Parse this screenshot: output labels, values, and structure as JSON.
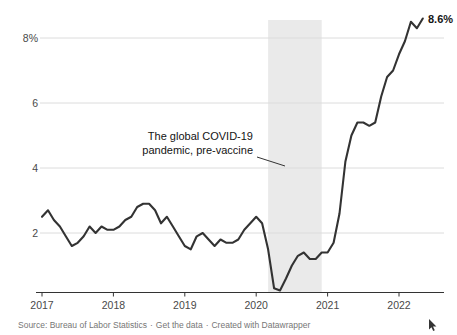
{
  "chart_data": {
    "type": "line",
    "series_name": "US inflation, 12-month change in consumer price index",
    "frequency": "monthly",
    "start": "2017-01",
    "end": "2022-05",
    "values": [
      2.5,
      2.7,
      2.4,
      2.2,
      1.9,
      1.6,
      1.7,
      1.9,
      2.2,
      2.0,
      2.2,
      2.1,
      2.1,
      2.2,
      2.4,
      2.5,
      2.8,
      2.9,
      2.9,
      2.7,
      2.3,
      2.5,
      2.2,
      1.9,
      1.6,
      1.5,
      1.9,
      2.0,
      1.8,
      1.6,
      1.8,
      1.7,
      1.7,
      1.8,
      2.1,
      2.3,
      2.5,
      2.3,
      1.5,
      0.3,
      0.1,
      0.6,
      1.0,
      1.3,
      1.4,
      1.2,
      1.2,
      1.4,
      1.4,
      1.7,
      2.6,
      4.2,
      5.0,
      5.4,
      5.4,
      5.3,
      5.4,
      6.2,
      6.8,
      7.0,
      7.5,
      7.9,
      8.5,
      8.3,
      8.6
    ],
    "x_tick_labels": [
      "2017",
      "2018",
      "2019",
      "2020",
      "2021",
      "2022"
    ],
    "y_ticks": [
      8,
      6,
      4,
      2
    ],
    "y_tick_labels": [
      "8%",
      "6",
      "4",
      "2"
    ],
    "ylim": [
      0,
      9
    ],
    "grid": true,
    "end_label": "8.6%",
    "annotation": {
      "line1": "The global COVID-19",
      "line2": "pandemic, pre-vaccine"
    },
    "shaded_region": {
      "from": "2020-03",
      "to": "2020-12"
    }
  },
  "footer": {
    "source_label": "Source: Bureau of Labor Statistics",
    "separator": "·",
    "get_data_label": "Get the data",
    "created_with_label": "Created with",
    "datawrapper_label": "Datawrapper"
  },
  "colors": {
    "line": "#333333",
    "band": "#eaeaea",
    "grid": "#dcdcdc",
    "axis": "#333333",
    "tick_label": "#494949",
    "annotation_text": "#141414",
    "source_text": "#767676"
  }
}
